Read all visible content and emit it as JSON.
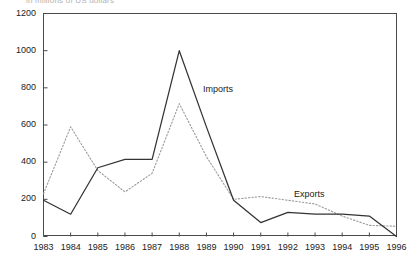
{
  "caption": "in millions of US dollars",
  "chart_data": {
    "type": "line",
    "title": "",
    "subtitle": "in millions of US dollars",
    "xlabel": "",
    "ylabel": "",
    "categories": [
      "1983",
      "1984",
      "1985",
      "1986",
      "1987",
      "1988",
      "1989",
      "1990",
      "1991",
      "1992",
      "1993",
      "1994",
      "1995",
      "1996"
    ],
    "x": [
      1983,
      1984,
      1985,
      1986,
      1987,
      1988,
      1989,
      1990,
      1991,
      1992,
      1993,
      1994,
      1995,
      1996
    ],
    "ylim": [
      0,
      1200
    ],
    "yticks": [
      0,
      200,
      400,
      600,
      800,
      1000,
      1200
    ],
    "ytick_labels": [
      "0",
      "200",
      "400",
      "600",
      "800",
      "1000",
      "1200"
    ],
    "grid": false,
    "legend_position": "inline-annotations",
    "series": [
      {
        "name": "Imports",
        "style": "solid",
        "color": "#333333",
        "values": [
          195,
          120,
          370,
          415,
          415,
          1000,
          590,
          195,
          75,
          130,
          120,
          120,
          110,
          0
        ]
      },
      {
        "name": "Exports",
        "style": "dotted",
        "color": "#9a9a9a",
        "values": [
          230,
          590,
          355,
          240,
          340,
          715,
          430,
          200,
          215,
          195,
          175,
          110,
          60,
          55
        ]
      }
    ],
    "annotations": [
      {
        "text": "Imports",
        "x": 1989,
        "y": 820
      },
      {
        "text": "Exports",
        "x": 1992,
        "y": 265
      }
    ]
  },
  "axis": {
    "y_tick_labels": [
      "1200",
      "1000",
      "800",
      "600",
      "400",
      "200",
      "0"
    ],
    "x_tick_labels": [
      "1983",
      "1984",
      "1985",
      "1986",
      "1987",
      "1988",
      "1989",
      "1990",
      "1991",
      "1992",
      "1993",
      "1994",
      "1995",
      "1996"
    ]
  },
  "colors": {
    "imports_line": "#333333",
    "exports_line": "#9a9a9a",
    "axis": "#4a4a4a",
    "text": "#222222"
  }
}
